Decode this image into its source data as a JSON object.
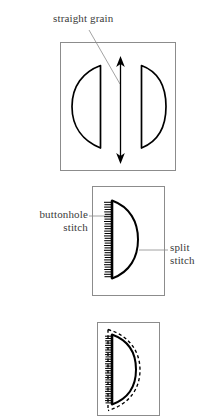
{
  "figure": {
    "type": "sewing-pattern-diagram",
    "panels": [
      {
        "id": "panel-grain",
        "name": "pattern-pieces-with-grainline",
        "box": {
          "x": 60,
          "y": 42,
          "width": 116,
          "height": 129
        },
        "elements": [
          {
            "name": "left-pattern-piece",
            "shape": "half-disc",
            "flat_edge": "right"
          },
          {
            "name": "right-pattern-piece",
            "shape": "half-disc",
            "flat_edge": "left"
          },
          {
            "name": "grainline-arrow",
            "shape": "double-headed-arrow",
            "orientation": "vertical"
          }
        ]
      },
      {
        "id": "panel-stitches",
        "name": "stitched-shape-labelled",
        "box": {
          "x": 92,
          "y": 186,
          "width": 73,
          "height": 110
        },
        "elements": [
          {
            "name": "buttonhole-stitch-edge",
            "shape": "ticked-straight-edge"
          },
          {
            "name": "split-stitch-curve",
            "shape": "curved-outline"
          }
        ]
      },
      {
        "id": "panel-finished",
        "name": "finished-shape-with-seam-allowance",
        "box": {
          "x": 97,
          "y": 322,
          "width": 63,
          "height": 94
        },
        "elements": [
          {
            "name": "buttonhole-stitch-edge",
            "shape": "ticked-straight-edge"
          },
          {
            "name": "split-stitch-curve",
            "shape": "curved-outline"
          },
          {
            "name": "seam-allowance-outline",
            "shape": "dashed-curve"
          }
        ]
      }
    ]
  },
  "labels": {
    "straight_grain": "straight grain",
    "buttonhole_stitch": "buttonhole\nstitch",
    "split_stitch": "split\nstitch"
  },
  "colors": {
    "ink": "#000000",
    "text": "#3a3a3a",
    "box_border": "#8c8c8c",
    "leader_line": "#8c8c8c",
    "background": "#ffffff"
  }
}
